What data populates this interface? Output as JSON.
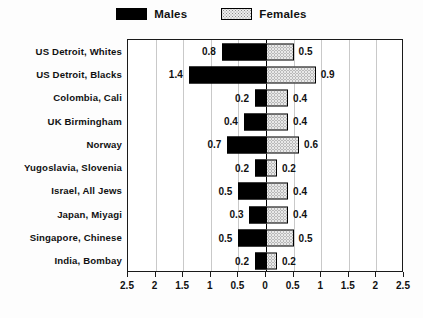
{
  "legend": {
    "entries": [
      {
        "label": "Males",
        "swatch": "solid-black-swatch"
      },
      {
        "label": "Females",
        "swatch": "stippled-swatch"
      }
    ]
  },
  "chart_data": {
    "type": "bar",
    "orientation": "horizontal-diverging",
    "title": "",
    "xlabel": "",
    "ylabel": "",
    "xlim": [
      -2.5,
      2.5
    ],
    "grid": true,
    "legend_position": "top-center",
    "categories": [
      "US Detroit, Whites",
      "US Detroit, Blacks",
      "Colombia, Cali",
      "UK Birmingham",
      "Norway",
      "Yugoslavia, Slovenia",
      "Israel, All Jews",
      "Japan, Miyagi",
      "Singapore, Chinese",
      "India, Bombay"
    ],
    "series": [
      {
        "name": "Males",
        "direction": "left",
        "color": "#000000",
        "values": [
          0.8,
          1.4,
          0.2,
          0.4,
          0.7,
          0.2,
          0.5,
          0.3,
          0.5,
          0.2
        ],
        "labels": [
          "0.8",
          "1.4",
          "0.2",
          "0.4",
          "0.7",
          "0.2",
          "0.5",
          "0.3",
          "0.5",
          "0.2"
        ]
      },
      {
        "name": "Females",
        "direction": "right",
        "color": "#e8e8e8",
        "values": [
          0.5,
          0.9,
          0.4,
          0.4,
          0.6,
          0.2,
          0.4,
          0.4,
          0.5,
          0.2
        ],
        "labels": [
          "0.5",
          "0.9",
          "0.4",
          "0.4",
          "0.6",
          "0.2",
          "0.4",
          "0.4",
          "0.5",
          "0.2"
        ]
      }
    ],
    "xticks": [
      -2.5,
      -2,
      -1.5,
      -1,
      -0.5,
      0,
      0.5,
      1,
      1.5,
      2,
      2.5
    ],
    "xticklabels": [
      "2.5",
      "2",
      "1.5",
      "1",
      "0.5",
      "0",
      "0.5",
      "1",
      "1.5",
      "2",
      "2.5"
    ]
  },
  "colors": {
    "males": "#000000",
    "females_fill": "#e8e8e8",
    "axis": "#1a1a1a",
    "grid": "#c9c9c9",
    "text": "#111111",
    "background": "#fdfdfd"
  }
}
